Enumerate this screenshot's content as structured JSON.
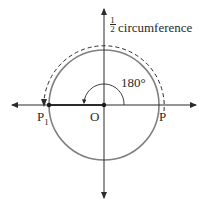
{
  "diagram": {
    "type": "unit circle half rotation",
    "labels": {
      "fraction_numerator": "1",
      "fraction_denominator": "2",
      "circumference": "circumference",
      "angle": "180°",
      "origin": "O",
      "point_start": "P",
      "point_end": "P",
      "point_end_subscript": "1"
    },
    "colors": {
      "circle": "#808080",
      "axes": "#2a2a2a",
      "text": "#2a2a2a"
    }
  }
}
